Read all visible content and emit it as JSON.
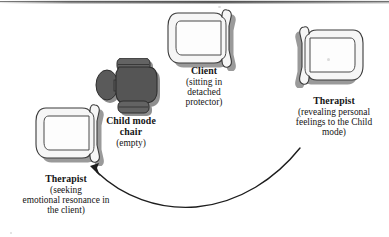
{
  "figure": {
    "background_color": "#ffffff",
    "width": 389,
    "height": 237
  },
  "labels": {
    "client": {
      "title": "Client",
      "detail_lines": [
        "(sitting in",
        "detached",
        "protector)"
      ],
      "detail": "(sitting in detached protector)"
    },
    "child_mode_chair": {
      "title_lines": [
        "Child mode",
        "chair"
      ],
      "title": "Child mode chair",
      "detail": "(empty)"
    },
    "therapist_right": {
      "title": "Therapist",
      "detail_lines": [
        "(revealing personal",
        "feelings to the Child",
        "mode)"
      ],
      "detail": "(revealing personal feelings to the Child mode)"
    },
    "therapist_left": {
      "title": "Therapist",
      "detail_lines": [
        "(seeking",
        "emotional resonance in",
        "the client)"
      ],
      "detail": "(seeking emotional resonance in the client)"
    }
  },
  "chairs": [
    {
      "name": "client-chair",
      "label_key": "client",
      "fill": "#f4f4f4",
      "stroke": "#3b3b3b",
      "shadow": "#9a9a9a",
      "orientation": "opening-right",
      "x": 166,
      "y": 9
    },
    {
      "name": "child-mode-chair",
      "label_key": "child_mode_chair",
      "fill": "#5c5c5c",
      "stroke": "#2e2e2e",
      "shadow": "#8f8f8f",
      "orientation": "front-dark",
      "x": 95,
      "y": 58
    },
    {
      "name": "therapist-right-chair",
      "label_key": "therapist_right",
      "fill": "#f4f4f4",
      "stroke": "#3b3b3b",
      "shadow": "#9a9a9a",
      "orientation": "opening-left",
      "x": 291,
      "y": 26
    },
    {
      "name": "therapist-left-chair",
      "label_key": "therapist_left",
      "fill": "#f4f4f4",
      "stroke": "#3b3b3b",
      "shadow": "#9a9a9a",
      "orientation": "opening-right",
      "x": 34,
      "y": 104
    }
  ],
  "arrow": {
    "name": "movement-arrow",
    "description": "curved arrow from therapist (right) position sweeping down and left to therapist (left) position",
    "color": "#1d1d1d",
    "from": "therapist-right-chair",
    "to": "therapist-left-chair"
  },
  "colors": {
    "ink": "#151515",
    "chair_light_fill": "#f4f4f4",
    "chair_dark_fill": "#5c5c5c",
    "outline": "#3b3b3b",
    "shadow": "#9a9a9a",
    "page": "#ffffff"
  }
}
